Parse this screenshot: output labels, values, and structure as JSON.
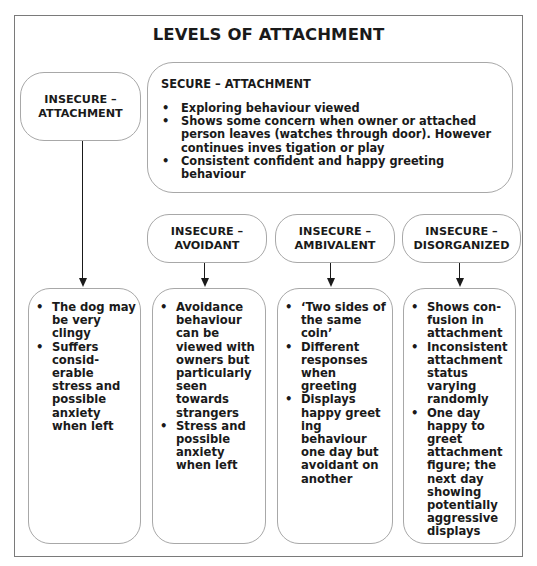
{
  "title": "LEVELS OF ATTACHMENT",
  "insecure_root": {
    "label_line1": "INSECURE –",
    "label_line2": "ATTACHMENT"
  },
  "secure": {
    "heading": "SECURE – ATTACHMENT",
    "bullets": [
      "Exploring behaviour viewed",
      "Shows some concern when owner or attached person leaves (watches through door). However continues inves tigation or play",
      "Consistent confident and happy greeting behaviour"
    ]
  },
  "subtypes": [
    {
      "label_line1": "INSECURE –",
      "label_line2": "AVOIDANT"
    },
    {
      "label_line1": "INSECURE –",
      "label_line2": "AMBIVALENT"
    },
    {
      "label_line1": "INSECURE –",
      "label_line2": "DISORGANIZED"
    }
  ],
  "details": [
    {
      "bullets": [
        "The dog may be very clingy",
        "Suffers consid- erable stress and possible anxiety when left"
      ]
    },
    {
      "bullets": [
        "Avoidance behaviour can be viewed with owners but particularly seen towards strangers",
        "Stress and possible anxiety when left"
      ]
    },
    {
      "bullets": [
        "‘Two sides of the same coin’",
        "Different responses when greeting",
        "Displays happy greet ing behaviour one day but avoidant on another"
      ]
    },
    {
      "bullets": [
        "Shows con- fusion in attachment",
        "Inconsistent attachment status varying randomly",
        "One day happy to greet attachment figure; the next day showing potentially aggressive displays"
      ]
    }
  ],
  "colors": {
    "frame_border": "#7a7a7a",
    "box_border": "#a8a8a8",
    "text": "#1a1a1a",
    "background": "#ffffff"
  }
}
